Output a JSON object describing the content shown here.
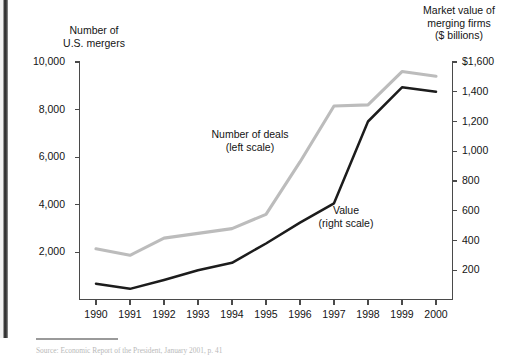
{
  "figure": {
    "left_axis_title": "Number of\nU.S. mergers",
    "right_axis_title": "Market value of\nmerging firms\n($ billions)",
    "source_note": "Source: Economic Report of the President, January 2001, p. 41"
  },
  "chart_data": {
    "type": "line",
    "title": "",
    "xlabel": "",
    "grid": false,
    "legend_position": "in-plot annotations",
    "x": [
      1990,
      1991,
      1992,
      1993,
      1994,
      1995,
      1996,
      1997,
      1998,
      1999,
      2000
    ],
    "x_tick_labels": [
      "1990",
      "1991",
      "1992",
      "1993",
      "1994",
      "1995",
      "1996",
      "1997",
      "1998",
      "1999",
      "2000"
    ],
    "axes": [
      {
        "id": "left",
        "label": "Number of U.S. mergers",
        "ylim": [
          0,
          10000
        ],
        "ticks": [
          2000,
          4000,
          6000,
          8000,
          10000
        ],
        "tick_labels": [
          "2,000",
          "4,000",
          "6,000",
          "8,000",
          "10,000"
        ]
      },
      {
        "id": "right",
        "label": "Market value of merging firms ($ billions)",
        "ylim": [
          0,
          1600
        ],
        "ticks": [
          200,
          400,
          600,
          800,
          1000,
          1200,
          1400,
          1600
        ],
        "tick_labels": [
          "200",
          "400",
          "600",
          "800",
          "1,000",
          "1,200",
          "1,400",
          "$1,600"
        ]
      }
    ],
    "series": [
      {
        "name": "Number of deals (left scale)",
        "annotation": "Number of deals\n(left scale)",
        "axis": "left",
        "color": "#bcbcbc",
        "values": [
          2150,
          1880,
          2600,
          2800,
          3000,
          3600,
          5800,
          8150,
          8200,
          9600,
          9400
        ]
      },
      {
        "name": "Value (right scale)",
        "annotation": "Value\n(right scale)",
        "axis": "right",
        "color": "#1c1c1c",
        "values": [
          110,
          75,
          135,
          200,
          250,
          380,
          520,
          650,
          1200,
          1430,
          1400
        ]
      }
    ]
  }
}
